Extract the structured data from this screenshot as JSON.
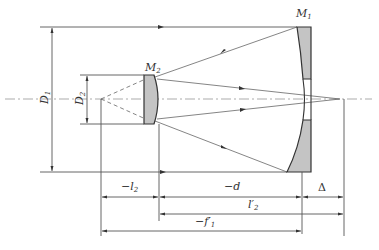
{
  "diagram": {
    "type": "Cassegrain two-mirror telescope optical layout",
    "mirrors": [
      {
        "id": "M1",
        "label": "M",
        "sub": "1",
        "role": "primary mirror (concave, with central hole)"
      },
      {
        "id": "M2",
        "label": "M",
        "sub": "2",
        "role": "secondary mirror (convex)"
      }
    ],
    "diameters": [
      {
        "label": "D",
        "sub": "1",
        "meaning": "primary aperture"
      },
      {
        "label": "D",
        "sub": "2",
        "meaning": "secondary aperture"
      }
    ],
    "dimensions": [
      {
        "label": "−l",
        "sub": "2",
        "row": 1
      },
      {
        "label": "−d",
        "sub": "",
        "row": 1
      },
      {
        "label": "Δ",
        "sub": "",
        "row": 1
      },
      {
        "label": "l",
        "sub": "2",
        "prime": "′",
        "row": 2
      },
      {
        "label": "−f",
        "sub": "1",
        "prime": "′",
        "row": 3
      }
    ],
    "colors": {
      "mirror_fill": "#c4c4c4",
      "outline": "#333333",
      "line": "#555555",
      "background": "#ffffff"
    }
  }
}
